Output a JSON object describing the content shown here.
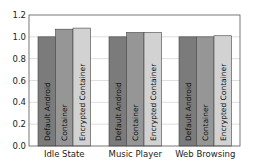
{
  "chart_data": {
    "type": "bar",
    "title": "",
    "xlabel": "",
    "ylabel": "",
    "ylim": [
      0,
      1.2
    ],
    "yticks": [
      "0.0",
      "0.2",
      "0.4",
      "0.6",
      "0.8",
      "1.0",
      "1.2"
    ],
    "grid": true,
    "legend": "none (bar labels written inside bars)",
    "categories": [
      "Idle State",
      "Music Player",
      "Web Browsing"
    ],
    "series": [
      {
        "name": "Default Android",
        "values": [
          1.0,
          1.0,
          1.0
        ],
        "color": "#7b7b7b"
      },
      {
        "name": "Container",
        "values": [
          1.07,
          1.04,
          1.0
        ],
        "color": "#969696"
      },
      {
        "name": "Encrypted Container",
        "values": [
          1.08,
          1.04,
          1.01
        ],
        "color": "#d2d2d2"
      }
    ]
  }
}
